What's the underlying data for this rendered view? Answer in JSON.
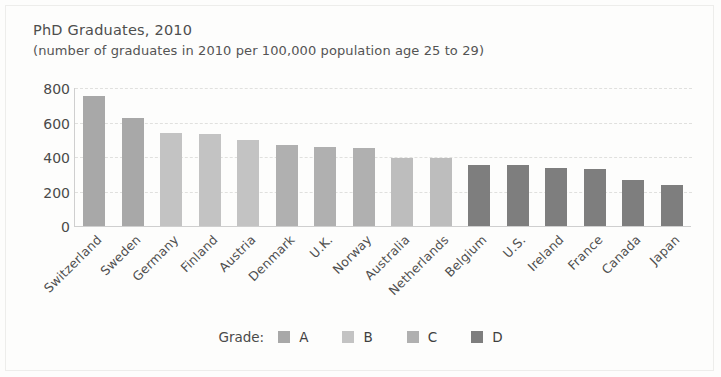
{
  "title": "PhD Graduates, 2010",
  "subtitle": "(number of graduates in 2010 per 100,000 population age 25 to 29)",
  "legend": {
    "title": "Grade:",
    "entries": [
      {
        "label": "A",
        "color": "#a8a8a8"
      },
      {
        "label": "B",
        "color": "#c3c3c3"
      },
      {
        "label": "C",
        "color": "#b0b0b0"
      },
      {
        "label": "D",
        "color": "#7e7e7e"
      }
    ]
  },
  "chart_data": {
    "type": "bar",
    "title": "PhD Graduates, 2010",
    "subtitle": "(number of graduates in 2010 per 100,000 population age 25 to 29)",
    "xlabel": "",
    "ylabel": "",
    "ylim": [
      0,
      800
    ],
    "yticks": [
      0,
      200,
      400,
      600,
      800
    ],
    "grid": true,
    "legend_position": "bottom",
    "categories": [
      "Switzerland",
      "Sweden",
      "Germany",
      "Finland",
      "Austria",
      "Denmark",
      "U.K.",
      "Norway",
      "Australia",
      "Netherlands",
      "Belgium",
      "U.S.",
      "Ireland",
      "France",
      "Canada",
      "Japan"
    ],
    "values": [
      755,
      625,
      540,
      535,
      500,
      470,
      460,
      450,
      395,
      393,
      355,
      352,
      337,
      333,
      268,
      238
    ],
    "grades": [
      "A",
      "A",
      "B",
      "B",
      "B",
      "C",
      "C",
      "C",
      "B",
      "B",
      "D",
      "D",
      "D",
      "D",
      "D",
      "D"
    ],
    "bar_colors": [
      "#a8a8a8",
      "#a8a8a8",
      "#c3c3c3",
      "#c3c3c3",
      "#c3c3c3",
      "#b0b0b0",
      "#b0b0b0",
      "#b0b0b0",
      "#bdbdbd",
      "#bdbdbd",
      "#7e7e7e",
      "#7e7e7e",
      "#7e7e7e",
      "#7e7e7e",
      "#7e7e7e",
      "#7e7e7e"
    ]
  }
}
